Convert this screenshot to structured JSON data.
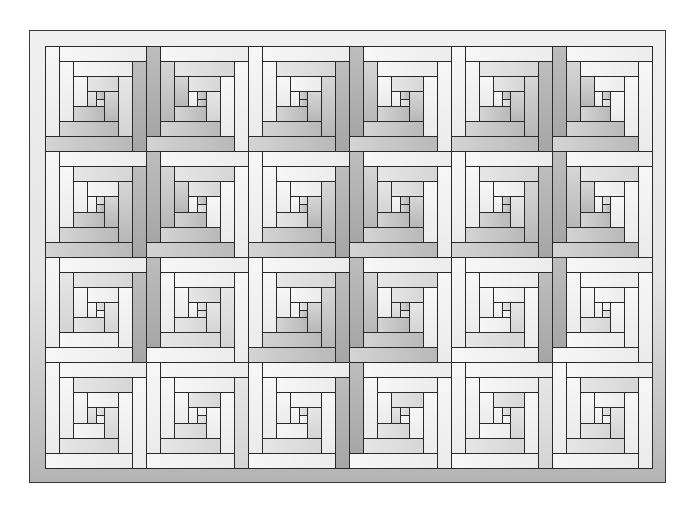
{
  "diagram": {
    "type": "quilt-pattern",
    "canvas": {
      "width": 694,
      "height": 509
    },
    "outer_border": {
      "x": 29,
      "y": 30,
      "w": 637,
      "h": 453
    },
    "inner_area": {
      "x": 45,
      "y": 46,
      "w": 607,
      "h": 422
    },
    "grid": {
      "columns": 6,
      "rows": 4,
      "col_edges": [
        45,
        146,
        248,
        349,
        451,
        552,
        652
      ],
      "row_edges": [
        46,
        151,
        257,
        362,
        468
      ]
    },
    "block": {
      "rings": 3,
      "log_width_ratio": 0.14,
      "note": "Each block: 3 concentric rings of 4 logs in a spiral, plus a 3-piece center. Shades: 0 white, 1 light gray, 2 mid gray, 3 dark gray. Ring log order: top, right, bottom, left."
    },
    "colors": {
      "outline": "#2a2a2a",
      "shade_0": "#f4f4f4",
      "shade_1": "#dedede",
      "shade_2": "#c6c6c6",
      "shade_3": "#ababab"
    },
    "blocks": [
      [
        {
          "rings": [
            [
              0,
              3,
              2,
              0
            ],
            [
              0,
              1,
              2,
              0
            ],
            [
              1,
              2,
              2,
              0
            ]
          ],
          "center": [
            1,
            2,
            1
          ]
        },
        {
          "rings": [
            [
              0,
              0,
              2,
              3
            ],
            [
              1,
              0,
              2,
              2
            ],
            [
              1,
              1,
              2,
              2
            ]
          ],
          "center": [
            0,
            2,
            2
          ]
        },
        {
          "rings": [
            [
              0,
              3,
              2,
              0
            ],
            [
              1,
              2,
              2,
              0
            ],
            [
              0,
              2,
              2,
              0
            ]
          ],
          "center": [
            0,
            2,
            2
          ]
        },
        {
          "rings": [
            [
              0,
              0,
              2,
              3
            ],
            [
              0,
              0,
              2,
              2
            ],
            [
              1,
              2,
              2,
              0
            ]
          ],
          "center": [
            0,
            2,
            1
          ]
        },
        {
          "rings": [
            [
              0,
              3,
              2,
              0
            ],
            [
              1,
              2,
              2,
              0
            ],
            [
              1,
              2,
              2,
              0
            ]
          ],
          "center": [
            0,
            2,
            1
          ]
        },
        {
          "rings": [
            [
              0,
              0,
              2,
              3
            ],
            [
              0,
              0,
              2,
              2
            ],
            [
              0,
              0,
              2,
              2
            ]
          ],
          "center": [
            0,
            2,
            1
          ]
        }
      ],
      [
        {
          "rings": [
            [
              0,
              3,
              2,
              0
            ],
            [
              1,
              2,
              2,
              0
            ],
            [
              0,
              2,
              2,
              0
            ]
          ],
          "center": [
            0,
            1,
            2
          ]
        },
        {
          "rings": [
            [
              0,
              0,
              2,
              3
            ],
            [
              1,
              0,
              2,
              2
            ],
            [
              1,
              0,
              2,
              2
            ]
          ],
          "center": [
            0,
            2,
            1
          ]
        },
        {
          "rings": [
            [
              0,
              3,
              2,
              0
            ],
            [
              0,
              2,
              2,
              0
            ],
            [
              0,
              2,
              1,
              0
            ]
          ],
          "center": [
            0,
            1,
            2
          ]
        },
        {
          "rings": [
            [
              0,
              0,
              2,
              3
            ],
            [
              1,
              0,
              2,
              2
            ],
            [
              1,
              2,
              2,
              1
            ]
          ],
          "center": [
            0,
            2,
            2
          ]
        },
        {
          "rings": [
            [
              0,
              3,
              2,
              0
            ],
            [
              1,
              2,
              2,
              0
            ],
            [
              0,
              1,
              2,
              0
            ]
          ],
          "center": [
            0,
            2,
            2
          ]
        },
        {
          "rings": [
            [
              0,
              0,
              2,
              3
            ],
            [
              1,
              0,
              2,
              2
            ],
            [
              0,
              0,
              2,
              2
            ]
          ],
          "center": [
            0,
            1,
            2
          ]
        }
      ],
      [
        {
          "rings": [
            [
              0,
              3,
              0,
              0
            ],
            [
              1,
              0,
              0,
              1
            ],
            [
              0,
              1,
              1,
              0
            ]
          ],
          "center": [
            0,
            1,
            0
          ]
        },
        {
          "rings": [
            [
              0,
              0,
              0,
              3
            ],
            [
              0,
              1,
              1,
              0
            ],
            [
              1,
              1,
              1,
              0
            ]
          ],
          "center": [
            0,
            1,
            1
          ]
        },
        {
          "rings": [
            [
              0,
              3,
              2,
              0
            ],
            [
              1,
              2,
              2,
              0
            ],
            [
              0,
              2,
              2,
              0
            ]
          ],
          "center": [
            0,
            1,
            2
          ]
        },
        {
          "rings": [
            [
              0,
              0,
              2,
              3
            ],
            [
              1,
              0,
              2,
              2
            ],
            [
              1,
              1,
              2,
              0
            ]
          ],
          "center": [
            1,
            2,
            1
          ]
        },
        {
          "rings": [
            [
              0,
              3,
              0,
              0
            ],
            [
              0,
              0,
              1,
              0
            ],
            [
              0,
              1,
              0,
              0
            ]
          ],
          "center": [
            0,
            1,
            0
          ]
        },
        {
          "rings": [
            [
              0,
              0,
              0,
              3
            ],
            [
              0,
              0,
              0,
              0
            ],
            [
              0,
              0,
              1,
              0
            ]
          ],
          "center": [
            0,
            0,
            1
          ]
        }
      ],
      [
        {
          "rings": [
            [
              0,
              0,
              0,
              0
            ],
            [
              1,
              0,
              1,
              0
            ],
            [
              0,
              1,
              0,
              0
            ]
          ],
          "center": [
            1,
            1,
            0
          ]
        },
        {
          "rings": [
            [
              0,
              1,
              0,
              0
            ],
            [
              0,
              0,
              1,
              0
            ],
            [
              1,
              0,
              1,
              0
            ]
          ],
          "center": [
            0,
            0,
            1
          ]
        },
        {
          "rings": [
            [
              0,
              3,
              0,
              0
            ],
            [
              0,
              0,
              1,
              0
            ],
            [
              0,
              1,
              0,
              0
            ]
          ],
          "center": [
            0,
            1,
            0
          ]
        },
        {
          "rings": [
            [
              0,
              0,
              0,
              3
            ],
            [
              0,
              0,
              1,
              0
            ],
            [
              1,
              0,
              1,
              0
            ]
          ],
          "center": [
            1,
            1,
            0
          ]
        },
        {
          "rings": [
            [
              0,
              1,
              0,
              0
            ],
            [
              0,
              0,
              1,
              0
            ],
            [
              1,
              1,
              0,
              0
            ]
          ],
          "center": [
            0,
            1,
            0
          ]
        },
        {
          "rings": [
            [
              0,
              0,
              0,
              0
            ],
            [
              1,
              0,
              1,
              0
            ],
            [
              0,
              1,
              1,
              0
            ]
          ],
          "center": [
            0,
            1,
            0
          ]
        }
      ]
    ]
  }
}
